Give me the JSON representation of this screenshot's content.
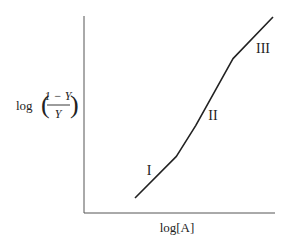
{
  "chart_data": {
    "type": "line",
    "title": "",
    "xlabel": "log[A]",
    "ylabel": "log((1 − Y)/Y)",
    "ylabel_parts": {
      "prefix": "log",
      "numerator": "1 − Y",
      "denominator": "Y"
    },
    "grid": false,
    "legend": null,
    "ticks": {
      "x": [],
      "y": []
    },
    "series": [
      {
        "name": "curve",
        "x": [
          0.0,
          0.3,
          0.44,
          0.71,
          1.0
        ],
        "y": [
          0.0,
          0.23,
          0.4,
          0.77,
          1.0
        ]
      }
    ],
    "annotations": [
      {
        "text": "I",
        "region": "lower segment"
      },
      {
        "text": "II",
        "region": "middle steep segment"
      },
      {
        "text": "III",
        "region": "upper segment"
      }
    ]
  },
  "colors": {
    "line": "#222222",
    "axis": "#555555",
    "background": "#ffffff"
  }
}
